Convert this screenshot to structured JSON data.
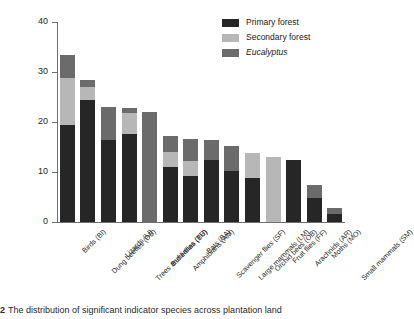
{
  "chart_data": {
    "type": "bar",
    "subtype": "stacked-bar",
    "title": "",
    "xlabel": "",
    "ylabel": "Significant ecological indicator species\n(% of total species)",
    "ylim": [
      0,
      40
    ],
    "yticks": [
      0,
      10,
      20,
      30,
      40
    ],
    "ytick_labels": [
      "0",
      "10",
      "20",
      "30",
      "40"
    ],
    "grid": false,
    "legend_position": "top-right",
    "categories": [
      "Birds (BI)",
      "Dung beetles (DB)",
      "Lizards (LI)",
      "Trees and lianas (TR)",
      "Butterflies (BU)",
      "Amphibians (AM)",
      "Bats (BA)",
      "Scavenger flies (SF)",
      "Large mammals (LM)",
      "Orchid bees (OB)",
      "Fruit flies (FF)",
      "Arachnids (AR)",
      "Moths (MO)",
      "Small mammals (SM)"
    ],
    "series": [
      {
        "name": "Primary forest",
        "color": "#262626",
        "values": [
          19.4,
          24.4,
          16.4,
          17.6,
          0.0,
          11.0,
          9.2,
          12.4,
          10.2,
          8.8,
          0.0,
          12.4,
          4.8,
          1.6
        ]
      },
      {
        "name": "Secondary forest",
        "color": "#b7b7b7",
        "values": [
          9.4,
          2.6,
          0.0,
          4.2,
          0.0,
          3.0,
          3.0,
          0.0,
          0.0,
          5.0,
          13.0,
          0.0,
          0.0,
          0.0
        ]
      },
      {
        "name": "Eucalyptus",
        "color": "#6b6b6b",
        "values": [
          4.7,
          1.4,
          6.6,
          1.0,
          22.0,
          3.2,
          4.4,
          4.0,
          5.0,
          0.0,
          0.0,
          0.0,
          2.6,
          1.2
        ]
      }
    ],
    "totals": [
      33.5,
      28.4,
      23.0,
      22.8,
      22.0,
      17.2,
      16.6,
      16.4,
      15.2,
      13.8,
      13.0,
      12.4,
      7.4,
      2.8
    ]
  },
  "legend": {
    "items": [
      {
        "label": "Primary forest",
        "color": "#262626",
        "italic": false
      },
      {
        "label": "Secondary forest",
        "color": "#b7b7b7",
        "italic": false
      },
      {
        "label": "Eucalyptus",
        "color": "#6b6b6b",
        "italic": true
      }
    ]
  },
  "caption": {
    "marker": "2",
    "text": "The distribution of significant indicator species across plantation land"
  }
}
